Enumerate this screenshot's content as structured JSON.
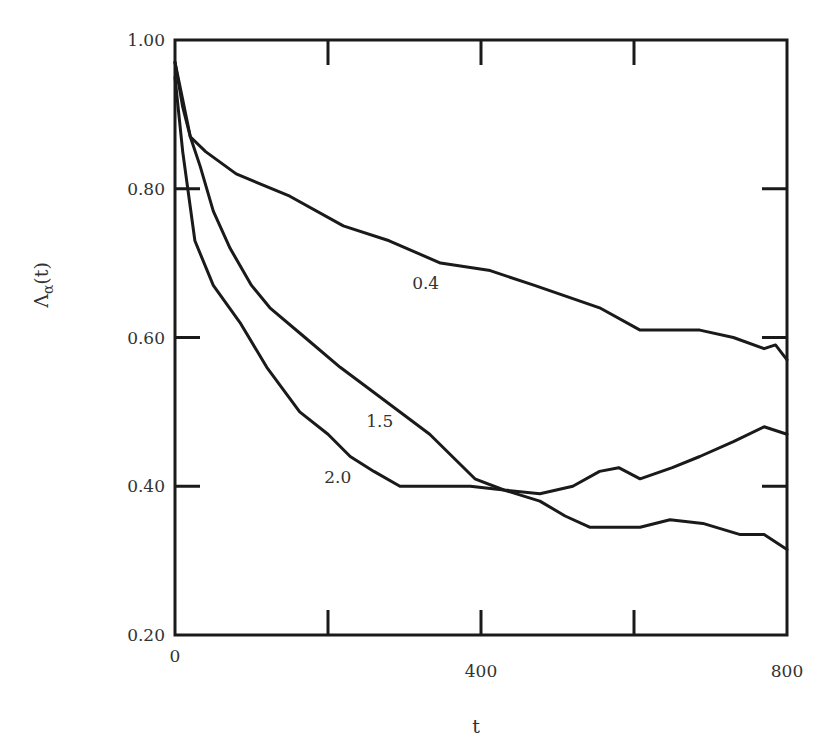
{
  "chart_data": {
    "type": "line",
    "title": "",
    "xlabel": "t",
    "ylabel": "Λα(t)",
    "ylabel_main": "Λ",
    "ylabel_sub": "α",
    "ylabel_arg": "(t)",
    "xlim": [
      0,
      800
    ],
    "ylim": [
      0.2,
      1.0
    ],
    "x_ticks": [
      0,
      200,
      400,
      600,
      800
    ],
    "x_tick_labels": [
      "0",
      "",
      "400",
      "",
      "800"
    ],
    "y_ticks": [
      0.2,
      0.4,
      0.6,
      0.8,
      1.0
    ],
    "y_tick_labels": [
      "0.20",
      "0.40",
      "0.60",
      "0.80",
      "1.00"
    ],
    "grid": false,
    "legend": "inline curve labels",
    "series": [
      {
        "name": "0.4",
        "label_pos": {
          "t": 310,
          "y": 0.665
        },
        "x": [
          0,
          10,
          20,
          40,
          80,
          150,
          220,
          280,
          347,
          412,
          470,
          555,
          608,
          686,
          730,
          770,
          785,
          800
        ],
        "y": [
          0.97,
          0.91,
          0.87,
          0.85,
          0.82,
          0.79,
          0.75,
          0.73,
          0.7,
          0.69,
          0.67,
          0.64,
          0.61,
          0.61,
          0.6,
          0.585,
          0.59,
          0.57
        ]
      },
      {
        "name": "1.5",
        "label_pos": {
          "t": 250,
          "y": 0.48
        },
        "x": [
          0,
          10,
          20,
          33,
          50,
          72,
          100,
          124,
          170,
          216,
          268,
          333,
          392,
          430,
          477,
          520,
          555,
          580,
          608,
          650,
          686,
          730,
          770,
          800
        ],
        "y": [
          0.97,
          0.92,
          0.87,
          0.83,
          0.77,
          0.72,
          0.67,
          0.64,
          0.6,
          0.56,
          0.52,
          0.47,
          0.41,
          0.395,
          0.39,
          0.4,
          0.42,
          0.425,
          0.41,
          0.425,
          0.44,
          0.46,
          0.48,
          0.47
        ]
      },
      {
        "name": "2.0",
        "label_pos": {
          "t": 195,
          "y": 0.405
        },
        "x": [
          0,
          10,
          26,
          50,
          85,
          120,
          163,
          200,
          229,
          260,
          294,
          330,
          386,
          430,
          477,
          510,
          542,
          580,
          608,
          647,
          690,
          739,
          770,
          800
        ],
        "y": [
          0.95,
          0.85,
          0.73,
          0.67,
          0.62,
          0.56,
          0.5,
          0.47,
          0.44,
          0.42,
          0.4,
          0.4,
          0.4,
          0.395,
          0.38,
          0.36,
          0.345,
          0.345,
          0.345,
          0.355,
          0.35,
          0.335,
          0.335,
          0.315
        ]
      }
    ]
  }
}
